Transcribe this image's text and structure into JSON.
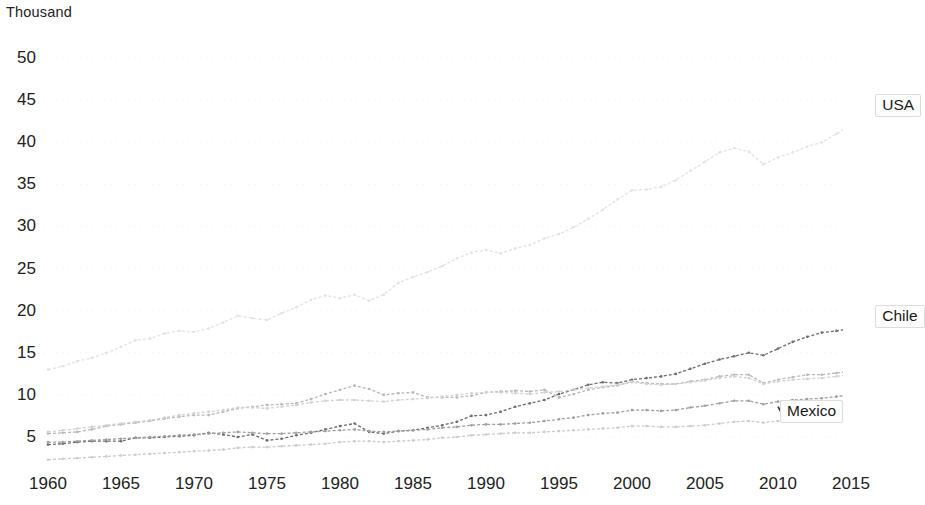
{
  "chart_data": {
    "type": "line",
    "title": "",
    "subtitle": "",
    "unit_label": "Thousand",
    "xlabel": "",
    "ylabel": "Thousand",
    "xlim": [
      1960,
      2017
    ],
    "ylim": [
      0,
      52
    ],
    "x_ticks": [
      1960,
      1965,
      1970,
      1975,
      1980,
      1985,
      1990,
      1995,
      2000,
      2005,
      2010,
      2015
    ],
    "y_ticks": [
      5,
      10,
      15,
      20,
      25,
      30,
      35,
      40,
      45,
      50
    ],
    "grid": true,
    "grid_style": "dotted-horizontal",
    "legend_position": "right-inline-labels",
    "x": [
      1960,
      1961,
      1962,
      1963,
      1964,
      1965,
      1966,
      1967,
      1968,
      1969,
      1970,
      1971,
      1972,
      1973,
      1974,
      1975,
      1976,
      1977,
      1978,
      1979,
      1980,
      1981,
      1982,
      1983,
      1984,
      1985,
      1986,
      1987,
      1988,
      1989,
      1990,
      1991,
      1992,
      1993,
      1994,
      1995,
      1996,
      1997,
      1998,
      1999,
      2000,
      2001,
      2002,
      2003,
      2004,
      2005,
      2006,
      2007,
      2008,
      2009,
      2010,
      2011,
      2012,
      2013,
      2014,
      2015,
      2016,
      2017
    ],
    "series": [
      {
        "name": "USA",
        "color": "#e3e3e3",
        "labeled": true,
        "label_text": "USA",
        "values": [
          13.0,
          13.4,
          14.0,
          14.4,
          15.0,
          15.7,
          16.5,
          16.7,
          17.3,
          17.6,
          17.5,
          17.9,
          18.6,
          19.4,
          19.1,
          18.9,
          19.7,
          20.4,
          21.3,
          21.8,
          21.5,
          21.9,
          21.2,
          21.9,
          23.3,
          24.0,
          24.6,
          25.3,
          26.2,
          26.9,
          27.2,
          26.8,
          27.4,
          27.8,
          28.6,
          29.1,
          29.9,
          30.9,
          32.0,
          33.2,
          34.3,
          34.4,
          34.7,
          35.5,
          36.6,
          37.7,
          38.8,
          39.3,
          38.9,
          37.4,
          38.2,
          38.8,
          39.5,
          40.0,
          41.0,
          42.0,
          42.4,
          43.2
        ]
      },
      {
        "name": "Chile",
        "color": "#6e6e6e",
        "labeled": true,
        "label_text": "Chile",
        "values": [
          4.1,
          4.2,
          4.4,
          4.5,
          4.5,
          4.5,
          4.9,
          4.9,
          5.0,
          5.1,
          5.2,
          5.5,
          5.3,
          5.0,
          5.3,
          4.6,
          4.8,
          5.2,
          5.5,
          5.9,
          6.3,
          6.6,
          5.6,
          5.4,
          5.7,
          5.8,
          6.1,
          6.4,
          6.8,
          7.5,
          7.6,
          8.0,
          8.6,
          9.0,
          9.4,
          10.1,
          10.6,
          11.2,
          11.5,
          11.4,
          11.8,
          12.0,
          12.2,
          12.5,
          13.1,
          13.7,
          14.2,
          14.6,
          15.0,
          14.7,
          15.5,
          16.3,
          16.9,
          17.4,
          17.6,
          17.9,
          18.1,
          18.3
        ]
      },
      {
        "name": "Mexico",
        "color": "#b9b9b9",
        "labeled": true,
        "label_text": "Mexico",
        "values": [
          5.4,
          5.5,
          5.6,
          5.9,
          6.3,
          6.5,
          6.7,
          6.9,
          7.2,
          7.4,
          7.6,
          7.6,
          8.0,
          8.4,
          8.6,
          8.8,
          8.9,
          9.0,
          9.5,
          10.1,
          10.6,
          11.1,
          10.7,
          10.0,
          10.2,
          10.3,
          9.7,
          9.7,
          9.7,
          9.9,
          10.3,
          10.4,
          10.5,
          10.4,
          10.6,
          9.7,
          10.1,
          10.6,
          10.9,
          11.1,
          11.6,
          11.4,
          11.3,
          11.3,
          11.6,
          11.8,
          12.2,
          12.4,
          12.4,
          11.4,
          11.8,
          12.1,
          12.4,
          12.4,
          12.6,
          12.8,
          12.9,
          13.1
        ]
      },
      {
        "name": "series-4",
        "color": "#d2d2d2",
        "labeled": false,
        "label_text": "",
        "values": [
          5.6,
          5.8,
          6.0,
          6.2,
          6.4,
          6.6,
          6.8,
          7.0,
          7.3,
          7.6,
          7.8,
          8.0,
          8.2,
          8.5,
          8.5,
          8.4,
          8.6,
          8.8,
          9.1,
          9.3,
          9.4,
          9.4,
          9.3,
          9.2,
          9.4,
          9.5,
          9.6,
          9.8,
          10.0,
          10.2,
          10.3,
          10.3,
          10.2,
          10.1,
          10.3,
          10.4,
          10.6,
          10.8,
          11.0,
          11.2,
          11.5,
          11.3,
          11.2,
          11.3,
          11.5,
          11.7,
          12.0,
          12.2,
          12.0,
          11.3,
          11.6,
          11.8,
          11.9,
          12.0,
          12.2,
          12.4,
          12.6,
          12.8
        ]
      },
      {
        "name": "series-5",
        "color": "#9f9f9f",
        "labeled": false,
        "label_text": "",
        "values": [
          4.4,
          4.4,
          4.5,
          4.6,
          4.7,
          4.8,
          4.9,
          5.0,
          5.1,
          5.2,
          5.3,
          5.4,
          5.5,
          5.6,
          5.5,
          5.4,
          5.4,
          5.5,
          5.6,
          5.7,
          5.8,
          5.9,
          5.7,
          5.6,
          5.7,
          5.8,
          5.9,
          6.1,
          6.2,
          6.4,
          6.5,
          6.5,
          6.6,
          6.7,
          6.9,
          7.1,
          7.3,
          7.6,
          7.8,
          7.9,
          8.2,
          8.2,
          8.1,
          8.2,
          8.5,
          8.7,
          9.0,
          9.3,
          9.3,
          8.9,
          9.2,
          9.4,
          9.5,
          9.6,
          9.8,
          10.0,
          10.1,
          10.3
        ]
      },
      {
        "name": "series-6",
        "color": "#cccccc",
        "labeled": false,
        "label_text": "",
        "values": [
          2.3,
          2.4,
          2.5,
          2.6,
          2.7,
          2.8,
          2.9,
          3.0,
          3.1,
          3.2,
          3.3,
          3.4,
          3.5,
          3.7,
          3.8,
          3.8,
          3.9,
          4.0,
          4.1,
          4.2,
          4.4,
          4.5,
          4.5,
          4.4,
          4.5,
          4.6,
          4.7,
          4.9,
          5.0,
          5.2,
          5.3,
          5.4,
          5.5,
          5.5,
          5.6,
          5.7,
          5.8,
          5.9,
          6.0,
          6.1,
          6.3,
          6.3,
          6.2,
          6.2,
          6.3,
          6.4,
          6.6,
          6.8,
          6.9,
          6.7,
          6.9,
          7.1,
          7.3,
          7.5,
          7.8,
          8.1,
          8.4,
          8.7
        ]
      }
    ],
    "annotations": [
      {
        "name": "mexico-leader-line",
        "from_x": 2010,
        "from_y": 8.6,
        "to_label": "Mexico"
      }
    ]
  },
  "labels": {
    "usa": "USA",
    "chile": "Chile",
    "mexico": "Mexico"
  }
}
